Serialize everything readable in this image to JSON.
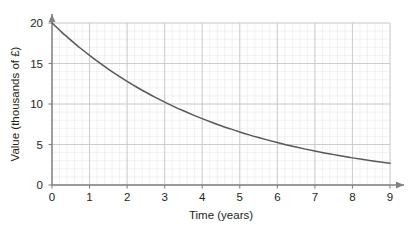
{
  "chart_data": {
    "type": "line",
    "title": "",
    "subtitle": "",
    "xlabel": "Time (years)",
    "ylabel": "Value (thousands of £)",
    "xlim": [
      0,
      9
    ],
    "ylim": [
      0,
      20
    ],
    "x_ticks": [
      0,
      1,
      2,
      3,
      4,
      5,
      6,
      7,
      8,
      9
    ],
    "x_tick_labels": [
      "0",
      "1",
      "2",
      "3",
      "4",
      "5",
      "6",
      "7",
      "8",
      "9"
    ],
    "y_ticks": [
      0,
      5,
      10,
      15,
      20
    ],
    "y_tick_labels": [
      "0",
      "5",
      "10",
      "15",
      "20"
    ],
    "grid": true,
    "minor_grid": true,
    "minor_divisions_x": 5,
    "minor_divisions_y": 5,
    "legend": "none",
    "series": [
      {
        "name": "Value",
        "color": "#58585a",
        "x": [
          0,
          0.25,
          0.5,
          0.75,
          1,
          1.25,
          1.5,
          1.75,
          2,
          2.25,
          2.5,
          2.75,
          3,
          3.25,
          3.5,
          3.75,
          4,
          4.25,
          4.5,
          4.75,
          5,
          5.25,
          5.5,
          5.75,
          6,
          6.25,
          6.5,
          6.75,
          7,
          7.25,
          7.5,
          7.75,
          8,
          8.25,
          8.5,
          8.75,
          9
        ],
        "values": [
          20.0,
          18.91,
          17.89,
          16.91,
          16.0,
          15.13,
          14.31,
          13.53,
          12.8,
          12.1,
          11.45,
          10.82,
          10.24,
          9.68,
          9.16,
          8.66,
          8.19,
          7.74,
          7.32,
          6.93,
          6.55,
          6.19,
          5.86,
          5.54,
          5.24,
          4.95,
          4.68,
          4.43,
          4.19,
          3.96,
          3.75,
          3.54,
          3.35,
          3.17,
          3.0,
          2.84,
          2.68
        ]
      }
    ],
    "axis_color": "#808285",
    "grid_major_color": "#c7c8ca",
    "grid_minor_color": "#e8e8ea",
    "curve_label": "",
    "annotations": []
  },
  "axes": {
    "x_title": "Time (years)",
    "y_title": "Value (thousands of £)"
  }
}
